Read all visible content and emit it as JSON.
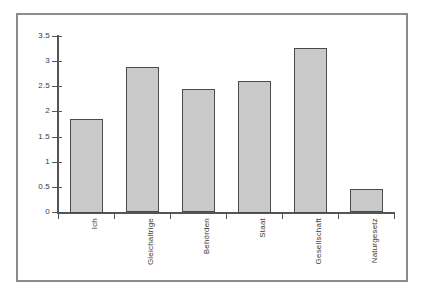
{
  "chart_data": {
    "type": "bar",
    "title": "",
    "subtitle": "",
    "xlabel": "",
    "ylabel": "",
    "categories": [
      "Ich",
      "Gleichaltrige",
      "Behörden",
      "Staat",
      "Gesellschaft",
      "Naturgesetz"
    ],
    "values": [
      1.86,
      2.89,
      2.45,
      2.62,
      3.28,
      0.46
    ],
    "ylim": [
      0,
      3.5
    ],
    "yticks": [
      0,
      0.5,
      1,
      1.5,
      2,
      2.5,
      3,
      3.5
    ],
    "ytick_labels": [
      "0",
      "0.5",
      "1",
      "1.5",
      "2",
      "2.5",
      "3",
      "3.5"
    ],
    "grid": false,
    "legend": false,
    "legend_position": "none",
    "bar_fill_color": "#c9c9c9",
    "bar_edge_color": "#4a4a4a",
    "axis_color": "#555555",
    "frame_color": "#8c8c8c",
    "text_color": "#3a3a3a",
    "category_label_rotation": "vertical"
  },
  "figure": {
    "border_color": "#8c8c8c",
    "background_color": "#ffffff"
  }
}
